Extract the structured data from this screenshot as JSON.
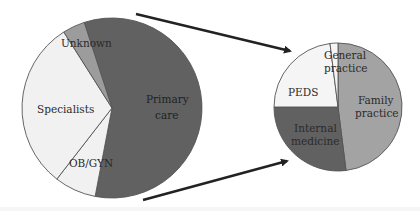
{
  "colors": {
    "primary_care": "#616161",
    "specialists": "#f1f1f1",
    "ob_gyn": "#f1f1f1",
    "unknown": "#9c9c9c",
    "family_practice": "#a3a3a3",
    "internal_medicine": "#616161",
    "peds": "#f5f5f5",
    "general_practice": "#f5f5f5",
    "outline": "#555555",
    "arrow": "#222222"
  },
  "chart_data": [
    {
      "type": "pie",
      "title": "",
      "categories": [
        "Primary care",
        "OB/GYN",
        "Specialists",
        "Unknown"
      ],
      "values": [
        58,
        7.5,
        30.5,
        4
      ],
      "start_angle_deg": -18,
      "direction": "clockwise",
      "legend": "none (inline labels)"
    },
    {
      "type": "pie",
      "title": "",
      "categories": [
        "Family practice",
        "Internal medicine",
        "PEDS",
        "General practice"
      ],
      "values": [
        48,
        27,
        23,
        2
      ],
      "start_angle_deg": 0,
      "direction": "clockwise",
      "legend": "none (inline labels)"
    }
  ],
  "labels": {
    "primary_care_1": "Primary",
    "primary_care_2": "care",
    "specialists": "Specialists",
    "ob_gyn": "OB/GYN",
    "unknown": "Unknown",
    "family_practice_1": "Family",
    "family_practice_2": "practice",
    "internal_medicine_1": "Internal",
    "internal_medicine_2": "medicine",
    "peds": "PEDS",
    "general_practice_1": "General",
    "general_practice_2": "practice"
  }
}
